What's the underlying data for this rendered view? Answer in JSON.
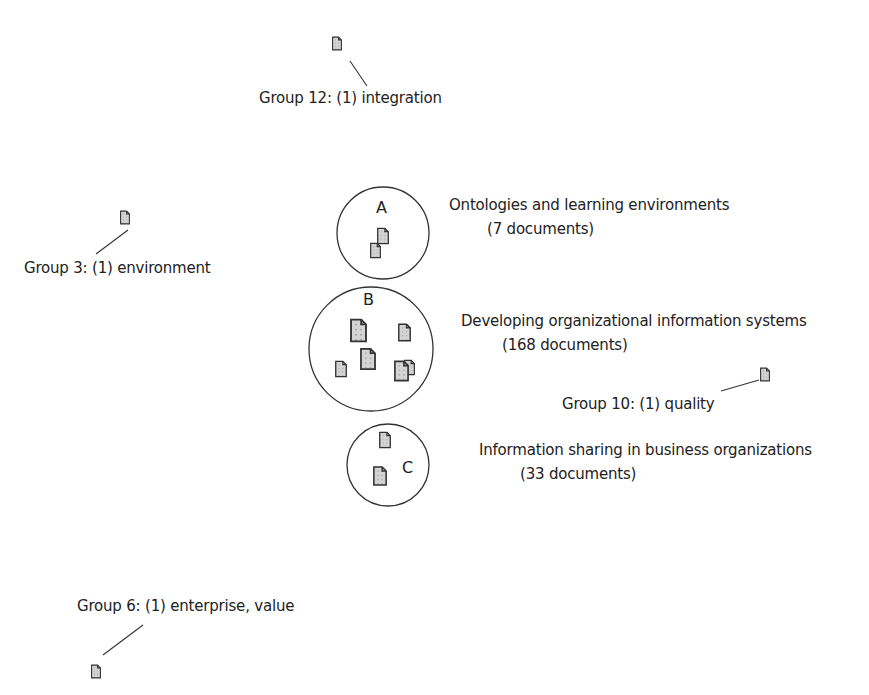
{
  "diagram": {
    "type": "document cluster map",
    "clusters": [
      {
        "id": "A",
        "letter": "A",
        "title": "Ontologies and learning environments",
        "count_label": "(7 documents)",
        "documents": 7
      },
      {
        "id": "B",
        "letter": "B",
        "title": "Developing organizational information systems",
        "count_label": "(168 documents)",
        "documents": 168
      },
      {
        "id": "C",
        "letter": "C",
        "title": "Information sharing in business organizations",
        "count_label": "(33 documents)",
        "documents": 33
      }
    ],
    "groups": [
      {
        "id": "group-12",
        "label": "Group 12: (1) integration"
      },
      {
        "id": "group-3",
        "label": "Group 3: (1) environment"
      },
      {
        "id": "group-10",
        "label": "Group 10: (1) quality"
      },
      {
        "id": "group-6",
        "label": "Group 6: (1) enterprise, value"
      }
    ],
    "colors": {
      "stroke": "#333333",
      "doc_fill": "#cfcfcf",
      "background": "#ffffff"
    }
  }
}
